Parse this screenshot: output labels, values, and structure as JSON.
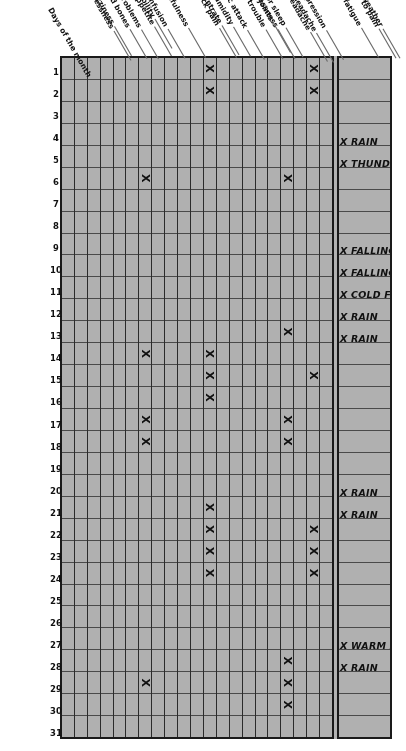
{
  "chart_data": {
    "type": "heatmap",
    "xlabel": "Days of the month",
    "ylabel": "Symptoms",
    "x": [
      1,
      2,
      3,
      4,
      5,
      6,
      7,
      8,
      9,
      10,
      11,
      12,
      13,
      14,
      15,
      16,
      17,
      18,
      19,
      20,
      21,
      22,
      23,
      24,
      25,
      26,
      27,
      28,
      29,
      30,
      31
    ],
    "categories": [
      "General fatigue",
      "Heightened sensitivity to pain",
      "Depression",
      "Headache",
      "Migraine headache",
      "Poor sleep",
      "Restlessness",
      "Pain in the joints",
      "Respiratory trouble",
      "Asthmatic attack",
      "Back pain",
      "Sensitivity to humidity",
      "Inability to concentrate",
      "Forgetfulness",
      "Confusion",
      "Irritability",
      "Loss of appetite",
      "Vision problems",
      "Dizziness",
      "Breathlessness",
      "Pain in scars or healed bones",
      "Daily weather"
    ],
    "series": [
      {
        "name": "General fatigue",
        "marked_days": []
      },
      {
        "name": "Heightened sensitivity to pain",
        "marked_days": [
          1,
          2,
          15,
          22,
          23,
          24
        ]
      },
      {
        "name": "Depression",
        "marked_days": []
      },
      {
        "name": "Headache",
        "marked_days": [
          6,
          13,
          17,
          18,
          28,
          29,
          30
        ]
      },
      {
        "name": "Migraine headache",
        "marked_days": []
      },
      {
        "name": "Poor sleep",
        "marked_days": []
      },
      {
        "name": "Restlessness",
        "marked_days": []
      },
      {
        "name": "Pain in the joints",
        "marked_days": []
      },
      {
        "name": "Respiratory trouble",
        "marked_days": []
      },
      {
        "name": "Asthmatic attack",
        "marked_days": [
          1,
          2,
          14,
          15,
          16,
          21,
          22,
          23,
          24
        ]
      },
      {
        "name": "Back pain",
        "marked_days": []
      },
      {
        "name": "Sensitivity to humidity",
        "marked_days": []
      },
      {
        "name": "Inability to concentrate",
        "marked_days": []
      },
      {
        "name": "Forgetfulness",
        "marked_days": []
      },
      {
        "name": "Confusion",
        "marked_days": [
          6,
          14,
          17,
          18,
          29
        ]
      },
      {
        "name": "Irritability",
        "marked_days": []
      },
      {
        "name": "Loss of appetite",
        "marked_days": []
      },
      {
        "name": "Vision problems",
        "marked_days": []
      },
      {
        "name": "Dizziness",
        "marked_days": []
      },
      {
        "name": "Breathlessness",
        "marked_days": []
      },
      {
        "name": "Pain in scars or healed bones",
        "marked_days": []
      }
    ],
    "weather_notes": [
      {
        "day": 5,
        "text": "X RAIN"
      },
      {
        "day": 6,
        "text": "X THUNDER"
      },
      {
        "day": 10,
        "text": "X FALLING BAROMETER"
      },
      {
        "day": 11,
        "text": "X FALLING BAROMETER"
      },
      {
        "day": 12,
        "text": "X COLD FRONT"
      },
      {
        "day": 13,
        "text": "X RAIN"
      },
      {
        "day": 14,
        "text": "X RAIN"
      },
      {
        "day": 21,
        "text": "X RAIN"
      },
      {
        "day": 22,
        "text": "X RAIN"
      },
      {
        "day": 28,
        "text": "X WARM FRONT"
      },
      {
        "day": 29,
        "text": "X RAIN"
      }
    ],
    "mark_glyph": "X",
    "axis_title": "Days of the month",
    "weather_row_label": "Daily weather",
    "grid": true,
    "legend": "none",
    "colors": {
      "paper": "#b3b3b3",
      "ink": "#111111",
      "rule": "#4a4a4a",
      "border": "#1a1a1a",
      "background": "#ffffff"
    }
  },
  "labels": {
    "axis_title": "Days of the month",
    "day_numbers": [
      "1",
      "2",
      "3",
      "4",
      "5",
      "6",
      "7",
      "8",
      "9",
      "10",
      "11",
      "12",
      "13",
      "14",
      "15",
      "16",
      "17",
      "18",
      "19",
      "20",
      "21",
      "22",
      "23",
      "24",
      "25",
      "26",
      "27",
      "28",
      "29",
      "30",
      "31"
    ],
    "symptom_rows": [
      "General fatigue",
      "Heightened sensitivity to pain",
      "Depression",
      "Headache",
      "Migraine headache",
      "Poor sleep",
      "Restlessness",
      "Pain in the joints",
      "Respiratory trouble",
      "Asthmatic attack",
      "Back pain",
      "Sensitivity to humidity",
      "Inability to concentrate",
      "Forgetfulness",
      "Confusion",
      "Irritability",
      "Loss of appetite",
      "Vision problems",
      "Dizziness",
      "Breathlessness",
      "Pain in scars or healed bones",
      "Daily weather"
    ]
  }
}
